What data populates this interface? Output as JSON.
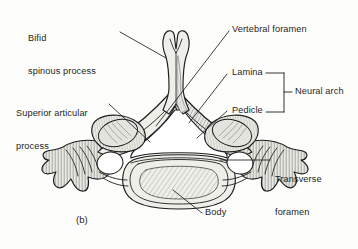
{
  "figure": {
    "caption": "(b)",
    "ink_color": "#1d1d1d",
    "bone_fill": "#efefea",
    "shade_fill": "#c9c9c4",
    "background": "#fdfdfb"
  },
  "labels": {
    "bifid_spinous_process": {
      "line1": "Bifid",
      "line2": "spinous process"
    },
    "superior_articular_process": {
      "line1": "Superior articular",
      "line2": "process"
    },
    "vertebral_foramen": {
      "line1": "Vertebral foramen"
    },
    "lamina": {
      "line1": "Lamina"
    },
    "pedicle": {
      "line1": "Pedicle"
    },
    "neural_arch": {
      "line1": "Neural arch"
    },
    "transverse_foramen": {
      "line1": "Transverse",
      "line2": "foramen"
    },
    "body": {
      "line1": "Body"
    }
  },
  "bracket": {
    "name": "neural-arch-bracket",
    "groups": [
      "Lamina",
      "Pedicle"
    ],
    "label": "Neural arch"
  },
  "leader_lines": [
    {
      "name": "leader-bifid-spinous-process",
      "from": [
        122,
        32
      ],
      "to": [
        166,
        57
      ]
    },
    {
      "name": "leader-superior-articular-process",
      "from": [
        110,
        104
      ],
      "to": [
        152,
        143
      ]
    },
    {
      "name": "leader-vertebral-foramen",
      "from": [
        228,
        31
      ],
      "to": [
        155,
        125
      ]
    },
    {
      "name": "leader-lamina",
      "from": [
        228,
        74
      ],
      "to": [
        189,
        122
      ]
    },
    {
      "name": "leader-pedicle",
      "from": [
        228,
        111
      ],
      "to": [
        196,
        137
      ]
    },
    {
      "name": "leader-transverse-foramen",
      "from": [
        272,
        160
      ],
      "to": [
        219,
        160
      ]
    },
    {
      "name": "leader-body",
      "from": [
        203,
        213
      ],
      "to": [
        172,
        189
      ]
    }
  ]
}
